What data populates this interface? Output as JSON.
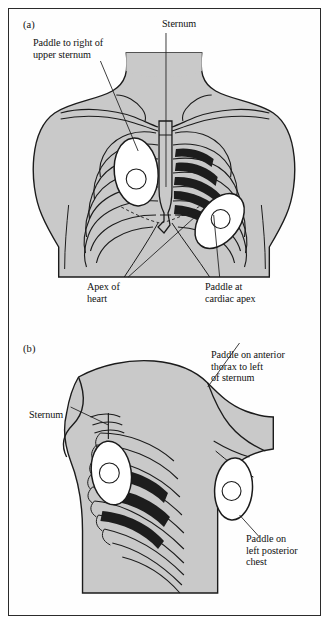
{
  "figure": {
    "background_color": "#fefefe",
    "frame_color": "#2b2b2b",
    "body_fill_color": "#c9c9c9",
    "paddle_fill_color": "#ffffff",
    "heart_shade_color": "#1d1d1d",
    "ink_color": "#1b1b1b"
  },
  "panel_a": {
    "letter": "(a)",
    "view": "anterior chest",
    "labels": {
      "paddle_upper_sternum": "Paddle to right of\nupper sternum",
      "sternum": "Sternum",
      "apex_of_heart": "Apex of\nheart",
      "paddle_cardiac_apex": "Paddle at\ncardiac apex"
    }
  },
  "panel_b": {
    "letter": "(b)",
    "view": "left oblique / lateral chest",
    "labels": {
      "paddle_anterior_thorax": "Paddle on anterior\nthorax to left\nof sternum",
      "sternum": "Sternum",
      "paddle_posterior_chest": "Paddle on\nleft posterior\nchest"
    }
  }
}
